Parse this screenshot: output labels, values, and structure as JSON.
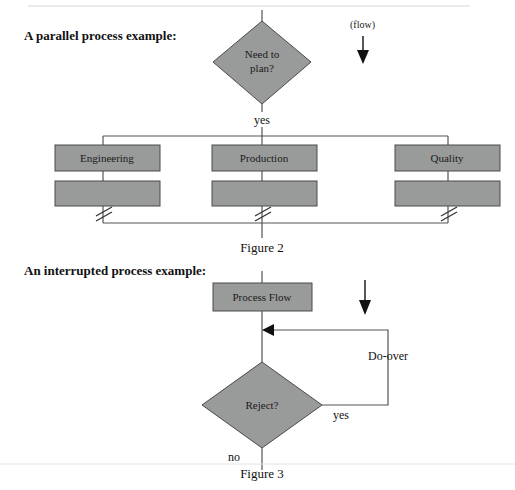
{
  "page": {
    "width": 515,
    "height": 490,
    "background": "#ffffff",
    "shape_fill": "#999a9a",
    "shape_stroke": "#4a4a4a",
    "line_color": "#555555",
    "text_color": "#111111"
  },
  "sections": {
    "parallel": {
      "heading": "A parallel process example:",
      "caption": "Figure 2",
      "flow_annotation": "(flow)",
      "decision": {
        "line1": "Need to",
        "line2": "plan?",
        "out_label": "yes"
      },
      "branches": [
        {
          "label": "Engineering"
        },
        {
          "label": "Production"
        },
        {
          "label": "Quality"
        }
      ]
    },
    "interrupted": {
      "heading": "An interrupted process example:",
      "caption": "Figure 3",
      "process_box": "Process Flow",
      "decision": {
        "label": "Reject?",
        "yes_label": "yes",
        "no_label": "no"
      },
      "loop_label": "Do-over"
    }
  }
}
